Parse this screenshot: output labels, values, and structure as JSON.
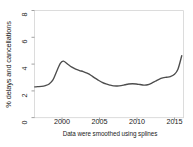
{
  "chart_data": {
    "type": "line",
    "title": "",
    "subtitle": "",
    "xlabel": "",
    "ylabel": "% delays and cancellations",
    "note": "Data were smoothed using splines",
    "xlim": [
      1996.5,
      2016.3
    ],
    "ylim": [
      0,
      8
    ],
    "grid": false,
    "legend": null,
    "xticks": [
      "2000",
      "2005",
      "2010",
      "2015"
    ],
    "xtick_values": [
      2000,
      2005,
      2010,
      2015
    ],
    "yticks": [
      "0",
      "2",
      "4",
      "6",
      "8"
    ],
    "ytick_values": [
      0,
      2,
      4,
      6,
      8
    ],
    "series": [
      {
        "name": "% delays and cancellations",
        "color": "#4d4d4d",
        "x": [
          1996.6,
          1997,
          1997.5,
          1998,
          1998.5,
          1999,
          1999.5,
          2000,
          2000.4,
          2001,
          2001.5,
          2002,
          2002.5,
          2003,
          2003.5,
          2004,
          2004.5,
          2005,
          2005.5,
          2006,
          2006.5,
          2007,
          2007.5,
          2008,
          2008.5,
          2009,
          2009.5,
          2010,
          2010.5,
          2011,
          2011.5,
          2012,
          2012.5,
          2013,
          2013.5,
          2014,
          2014.5,
          2015,
          2015.5,
          2016
        ],
        "y": [
          2.28,
          2.3,
          2.32,
          2.38,
          2.5,
          2.8,
          3.45,
          4.05,
          4.2,
          3.95,
          3.75,
          3.6,
          3.5,
          3.42,
          3.3,
          3.15,
          2.95,
          2.78,
          2.62,
          2.5,
          2.42,
          2.36,
          2.35,
          2.38,
          2.44,
          2.5,
          2.52,
          2.5,
          2.46,
          2.42,
          2.44,
          2.55,
          2.7,
          2.85,
          2.95,
          3.0,
          3.05,
          3.2,
          3.6,
          4.6
        ]
      }
    ]
  },
  "axis": {
    "y_title": "% delays and cancellations",
    "caption": "Data were smoothed using splines"
  }
}
